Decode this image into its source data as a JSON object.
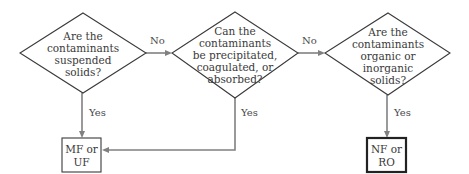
{
  "diagram": {
    "type": "flowchart",
    "decisions": [
      {
        "id": "d1",
        "lines": [
          "Are the",
          "contaminants",
          "suspended",
          "solids?"
        ]
      },
      {
        "id": "d2",
        "lines": [
          "Can the",
          "contaminants",
          "be precipitated,",
          "coagulated, or",
          "absorbed?"
        ]
      },
      {
        "id": "d3",
        "lines": [
          "Are the",
          "contaminants",
          "organic or",
          "inorganic",
          "solids?"
        ]
      }
    ],
    "outcomes": [
      {
        "id": "o1",
        "lines": [
          "MF or",
          "UF"
        ]
      },
      {
        "id": "o2",
        "lines": [
          "NF or",
          "RO"
        ]
      }
    ],
    "edges": [
      {
        "from": "d1",
        "to": "d2",
        "label": "No"
      },
      {
        "from": "d2",
        "to": "d3",
        "label": "No"
      },
      {
        "from": "d1",
        "to": "o1",
        "label": "Yes"
      },
      {
        "from": "d2",
        "to": "o1",
        "label": "Yes"
      },
      {
        "from": "d3",
        "to": "o2",
        "label": "Yes"
      }
    ]
  }
}
